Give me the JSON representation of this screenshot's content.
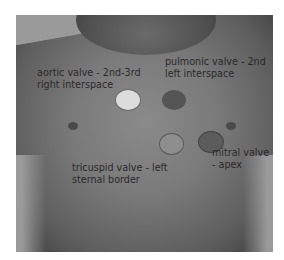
{
  "figure": {
    "points": [
      {
        "id": "aortic",
        "label_line1": "aortic valve - 2nd-3rd",
        "label_line2": "right interspace",
        "color": "#d8d8d8"
      },
      {
        "id": "pulmonic",
        "label_line1": "pulmonic valve - 2nd",
        "label_line2": "left interspace",
        "color": "#555555"
      },
      {
        "id": "tricuspid",
        "label_line1": "tricuspid valve - left",
        "label_line2": "sternal border",
        "color": "#8e8e8e"
      },
      {
        "id": "mitral",
        "label_line1": "mitral valve",
        "label_line2": "- apex",
        "color": "#5c5c5c"
      }
    ]
  }
}
